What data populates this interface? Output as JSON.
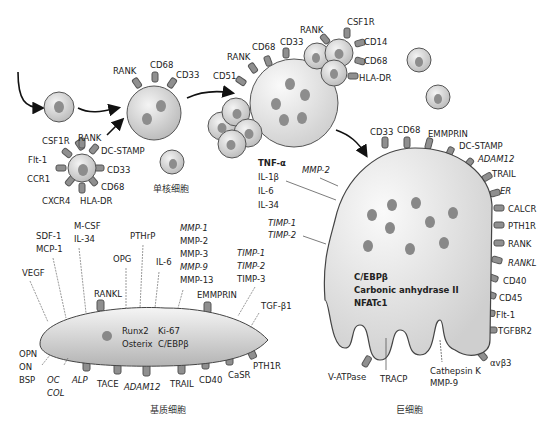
{
  "labels": {
    "monocyte_caption": "单核细胞",
    "stromal_caption": "基质细胞",
    "giant_caption": "巨细胞"
  },
  "precursor_markers": [
    "CSF1R",
    "RANK",
    "DC-STAMP",
    "CD33",
    "CD68",
    "HLA-DR",
    "CXCR4",
    "CCR1",
    "Flt-1"
  ],
  "monocyte_markers": [
    "RANK",
    "CD68",
    "CD33"
  ],
  "fusing_cell_markers": [
    "CD51",
    "RANK",
    "CD68",
    "CD33"
  ],
  "cluster_markers": [
    "RANK",
    "CSF1R",
    "CD14",
    "CD68",
    "HLA-DR"
  ],
  "secreted_factors": [
    "TNF-α",
    "IL-1β",
    "IL-6",
    "IL-34"
  ],
  "giant_cell": {
    "top_markers": [
      "CD33",
      "CD68",
      "EMMPRIN",
      "DC-STAMP",
      "ADAM12",
      "TRAIL",
      "ER",
      "CALCR",
      "PTH1R",
      "RANK",
      "RANKL",
      "CD40",
      "CD45",
      "Flt-1",
      "TGFBR2",
      "αvβ3"
    ],
    "internal": [
      "C/EBPβ",
      "Carbonic anhydrase II",
      "NFATc1"
    ],
    "secreted": [
      "MMP-2",
      "TIMP-1",
      "TIMP-2"
    ],
    "bottom": [
      "V-ATPase",
      "TRACP",
      "Cathepsin K",
      "MMP-9"
    ]
  },
  "stromal_cell": {
    "internal": [
      "Runx2",
      "Ki-67",
      "Osterix",
      "C/EBPβ"
    ],
    "secreted_top": [
      "VEGF",
      "SDF-1",
      "MCP-1",
      "M-CSF",
      "IL-34",
      "PTHrP",
      "OPG",
      "IL-6",
      "MMP-1",
      "MMP-2",
      "MMP-3",
      "MMP-9",
      "MMP-13",
      "TIMP-1",
      "TIMP-2",
      "TIMP-3",
      "TGF-β1"
    ],
    "surface_top": [
      "RANKL",
      "EMMPRIN"
    ],
    "left": [
      "OPN",
      "ON",
      "BSP"
    ],
    "bottom": [
      "OC",
      "COL",
      "ALP",
      "TACE",
      "ADAM12",
      "TRAIL",
      "CD40",
      "CaSR",
      "PTH1R"
    ]
  }
}
